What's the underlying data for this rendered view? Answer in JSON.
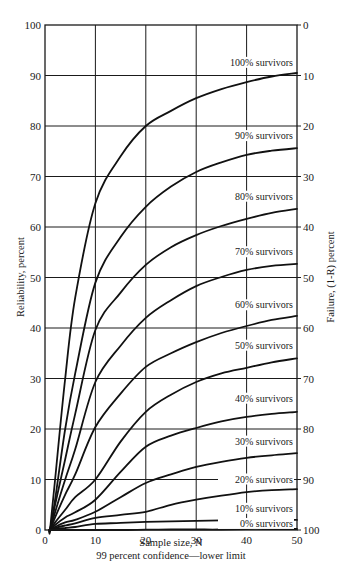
{
  "chart_data": {
    "type": "line",
    "title": "",
    "subtitle": "99 percent confidence—lower limit",
    "xlabel": "Sample size, N",
    "ylabel": "Reliability, percent",
    "y2label": "Failure, (1-R) percent",
    "xlim": [
      0,
      50
    ],
    "ylim": [
      0,
      100
    ],
    "y2lim": [
      100,
      0
    ],
    "grid": true,
    "legend_position": "inline-right",
    "x_ticks": [
      0,
      10,
      20,
      30,
      40,
      50
    ],
    "y_ticks": [
      0,
      10,
      20,
      30,
      40,
      50,
      60,
      70,
      80,
      90,
      100
    ],
    "y2_ticks": [
      100,
      90,
      80,
      70,
      60,
      50,
      40,
      30,
      20,
      10,
      0
    ],
    "x": [
      1,
      2,
      4,
      6,
      10,
      15,
      20,
      25,
      30,
      35,
      40,
      45,
      50
    ],
    "series": [
      {
        "name": "100% survivors",
        "values": [
          0,
          10,
          30,
          46,
          64.7,
          74,
          80,
          83,
          85.5,
          87.3,
          88.7,
          89.8,
          90.5
        ]
      },
      {
        "name": "90% survivors",
        "values": [
          0,
          6,
          20,
          31,
          49,
          58,
          64,
          68,
          70.9,
          72.8,
          74.3,
          75.1,
          75.6
        ]
      },
      {
        "name": "80% survivors",
        "values": [
          0,
          5,
          14,
          23,
          39.6,
          47,
          52.5,
          56,
          58.4,
          60.2,
          61.6,
          62.8,
          63.6
        ]
      },
      {
        "name": "70% survivors",
        "values": [
          0,
          3.5,
          10,
          16,
          29.3,
          36.5,
          42,
          45.5,
          48.3,
          50.1,
          51.5,
          52.3,
          52.7
        ]
      },
      {
        "name": "60% survivors",
        "values": [
          0,
          2.5,
          7,
          11,
          20.4,
          27,
          32.3,
          35,
          37.2,
          39,
          40.4,
          41.6,
          42.4
        ]
      },
      {
        "name": "50% survivors",
        "values": [
          0,
          1.5,
          4,
          6.5,
          10,
          17.5,
          23.4,
          26.8,
          29.3,
          31,
          32.1,
          33.2,
          34
        ]
      },
      {
        "name": "40% survivors",
        "values": [
          0,
          1,
          2.5,
          3.5,
          6,
          11.5,
          16.5,
          18.7,
          20.2,
          21.5,
          22.4,
          23,
          23.4
        ]
      },
      {
        "name": "30% survivors",
        "values": [
          0,
          0.6,
          1.5,
          2,
          3.6,
          6.5,
          9.3,
          11,
          12.5,
          13.5,
          14.3,
          14.8,
          15.2
        ]
      },
      {
        "name": "20% survivors",
        "values": [
          0,
          0.4,
          0.9,
          1.3,
          2.4,
          3,
          3.6,
          5,
          6,
          6.8,
          7.5,
          7.9,
          8.1
        ]
      },
      {
        "name": "10% survivors",
        "values": [
          0,
          0.2,
          0.4,
          0.6,
          1.2,
          1.4,
          1.6,
          1.7,
          1.8,
          1.9,
          1.95,
          2,
          2
        ]
      },
      {
        "name": "0% survivors",
        "values": [
          0,
          0,
          0,
          0,
          0,
          0,
          0.05,
          0.1,
          0.1,
          0.1,
          0.2,
          0.2,
          0.2
        ]
      }
    ],
    "annotations": [
      {
        "text": "100% survivors",
        "at_y": 92.5
      },
      {
        "text": "90% survivors",
        "at_y": 78
      },
      {
        "text": "80% survivors",
        "at_y": 66
      },
      {
        "text": "70% survivors",
        "at_y": 55
      },
      {
        "text": "60% survivors",
        "at_y": 44.5
      },
      {
        "text": "50% survivors",
        "at_y": 36.5
      },
      {
        "text": "40% survivors",
        "at_y": 26
      },
      {
        "text": "30% survivors",
        "at_y": 17.5
      },
      {
        "text": "20% survivors",
        "at_y": 10
      },
      {
        "text": "10% survivors",
        "at_y": 4.2
      },
      {
        "text": "0% survivors",
        "at_y": 1.2
      }
    ]
  }
}
